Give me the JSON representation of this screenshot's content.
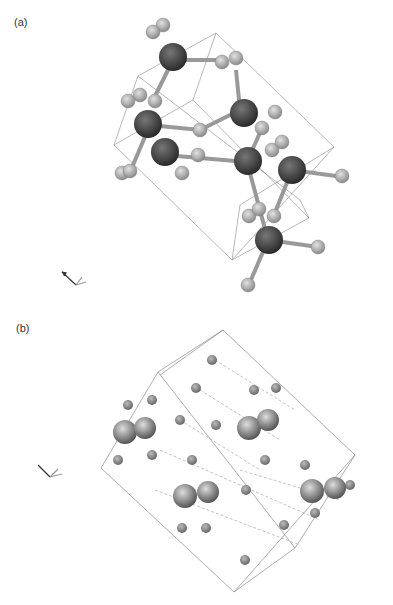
{
  "figure": {
    "panels": [
      {
        "label": "(a)",
        "atom_labels": {
          "Si": "Si",
          "O": "O"
        },
        "axes": {
          "c": "c",
          "b": "b",
          "a": "a"
        },
        "si_atoms": [
          [
            173,
            60
          ],
          [
            240,
            110
          ],
          [
            150,
            125
          ],
          [
            165,
            155
          ],
          [
            247,
            162
          ],
          [
            292,
            170
          ],
          [
            268,
            240
          ]
        ],
        "o_atoms": [
          [
            153,
            32
          ],
          [
            163,
            25
          ],
          [
            222,
            60
          ],
          [
            236,
            57
          ],
          [
            275,
            110
          ],
          [
            262,
            128
          ],
          [
            128,
            100
          ],
          [
            140,
            95
          ],
          [
            155,
            100
          ],
          [
            200,
            130
          ],
          [
            198,
            155
          ],
          [
            180,
            172
          ],
          [
            130,
            172
          ],
          [
            125,
            172
          ],
          [
            270,
            145
          ],
          [
            282,
            140
          ],
          [
            343,
            177
          ],
          [
            248,
            215
          ],
          [
            258,
            208
          ],
          [
            274,
            215
          ],
          [
            318,
            247
          ],
          [
            248,
            287
          ]
        ]
      },
      {
        "label": "(b)",
        "atom_labels": {
          "Ag": "Ag",
          "O": "O",
          "H": "H"
        },
        "axes": {
          "c": "c",
          "b": "b",
          "a": "a"
        }
      }
    ]
  }
}
